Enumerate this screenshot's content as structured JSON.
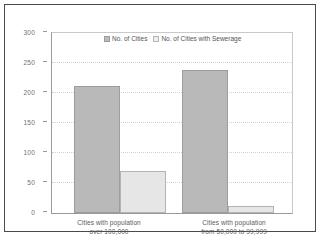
{
  "chart_data": {
    "type": "bar",
    "title": "",
    "xlabel": "",
    "ylabel": "",
    "ylim": [
      0,
      300
    ],
    "yticks": [
      0,
      50,
      100,
      150,
      200,
      250,
      300
    ],
    "grid": true,
    "legend_position": "top-center",
    "categories": [
      "Cities with population over 100,000",
      "Cities with population from 50,000 to 99,999"
    ],
    "category_lines": [
      [
        "Cities with population",
        "over 100,000"
      ],
      [
        "Cities with population",
        "from 50,000 to 99,999"
      ]
    ],
    "series": [
      {
        "name": "No. of Cities",
        "values": [
          212,
          239
        ],
        "color": "#b9b9b9"
      },
      {
        "name": "No. of Cities with Sewerage",
        "values": [
          70,
          12
        ],
        "color": "#e6e6e6"
      }
    ]
  },
  "legend": {
    "items": [
      {
        "label": "No. of Cities",
        "swatch": "dark"
      },
      {
        "label": "No. of Cities with Sewerage",
        "swatch": "light"
      }
    ]
  },
  "axis": {
    "y_tick_labels": [
      "300",
      "250",
      "200",
      "150",
      "100",
      "50",
      "0"
    ]
  }
}
